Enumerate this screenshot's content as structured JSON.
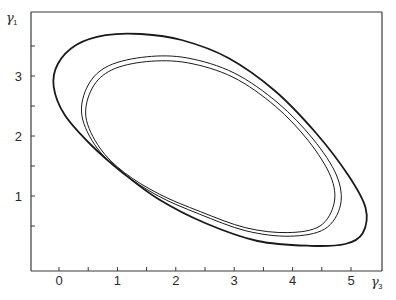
{
  "chart_data": {
    "type": "line",
    "title": "",
    "xlabel": "γ3",
    "ylabel": "γ1",
    "xlabel_main": "γ",
    "xlabel_sub": "3",
    "ylabel_main": "γ",
    "ylabel_sub": "1",
    "xlim": [
      -0.48,
      5.55
    ],
    "ylim": [
      -0.25,
      4.07
    ],
    "x_ticks": [
      0,
      0.5,
      1,
      1.5,
      2,
      2.5,
      3,
      3.5,
      4,
      4.5,
      5
    ],
    "x_tick_labels": [
      "0",
      "1",
      "2",
      "3",
      "4",
      "5"
    ],
    "x_tick_label_values": [
      0,
      1,
      2,
      3,
      4,
      5
    ],
    "y_ticks": [
      0.5,
      1,
      1.5,
      2,
      2.5,
      3,
      3.5
    ],
    "y_tick_labels": [
      "1",
      "2",
      "3"
    ],
    "y_tick_label_values": [
      1,
      2,
      3
    ],
    "grid": false,
    "legend": null,
    "series": [
      {
        "name": "outer closed orbit (thick)",
        "closed": true,
        "stroke_width": 1.8,
        "points": [
          [
            -0.09,
            2.82
          ],
          [
            -0.02,
            3.2
          ],
          [
            0.3,
            3.52
          ],
          [
            0.8,
            3.68
          ],
          [
            1.4,
            3.7
          ],
          [
            2.1,
            3.6
          ],
          [
            2.9,
            3.3
          ],
          [
            3.7,
            2.75
          ],
          [
            4.4,
            2.05
          ],
          [
            4.95,
            1.35
          ],
          [
            5.25,
            0.8
          ],
          [
            5.2,
            0.38
          ],
          [
            4.9,
            0.2
          ],
          [
            4.3,
            0.17
          ],
          [
            3.4,
            0.25
          ],
          [
            2.5,
            0.55
          ],
          [
            1.7,
            0.95
          ],
          [
            1.1,
            1.38
          ],
          [
            0.55,
            1.85
          ],
          [
            0.1,
            2.35
          ]
        ]
      },
      {
        "name": "inner closed orbit A",
        "closed": true,
        "stroke_width": 1.0,
        "points": [
          [
            0.39,
            2.35
          ],
          [
            0.5,
            2.85
          ],
          [
            0.85,
            3.17
          ],
          [
            1.5,
            3.32
          ],
          [
            2.2,
            3.3
          ],
          [
            3.0,
            3.05
          ],
          [
            3.75,
            2.55
          ],
          [
            4.35,
            1.95
          ],
          [
            4.75,
            1.35
          ],
          [
            4.82,
            0.85
          ],
          [
            4.55,
            0.45
          ],
          [
            3.95,
            0.33
          ],
          [
            3.2,
            0.42
          ],
          [
            2.4,
            0.7
          ],
          [
            1.7,
            1.0
          ],
          [
            1.1,
            1.38
          ],
          [
            0.65,
            1.8
          ]
        ]
      },
      {
        "name": "inner closed orbit B",
        "closed": true,
        "stroke_width": 1.0,
        "points": [
          [
            0.46,
            2.32
          ],
          [
            0.57,
            2.8
          ],
          [
            0.9,
            3.1
          ],
          [
            1.5,
            3.24
          ],
          [
            2.2,
            3.22
          ],
          [
            2.98,
            2.98
          ],
          [
            3.7,
            2.5
          ],
          [
            4.27,
            1.92
          ],
          [
            4.65,
            1.33
          ],
          [
            4.71,
            0.88
          ],
          [
            4.47,
            0.5
          ],
          [
            3.92,
            0.39
          ],
          [
            3.2,
            0.47
          ],
          [
            2.42,
            0.74
          ],
          [
            1.72,
            1.03
          ],
          [
            1.12,
            1.39
          ],
          [
            0.7,
            1.8
          ]
        ]
      }
    ]
  }
}
